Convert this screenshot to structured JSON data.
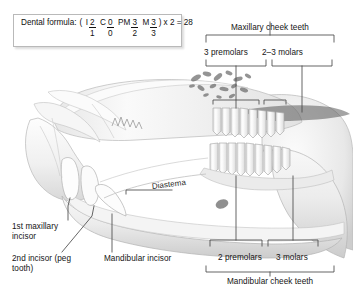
{
  "figure": {
    "background_color": "#ffffff",
    "line_color": "#3d3d3d",
    "bone_fill": "#f2f2f2",
    "bone_shadow": "#cfcfcf",
    "tooth_fill": "#fafafa"
  },
  "formula_box": {
    "label": "Dental formula:",
    "open_paren": "(",
    "close_paren": ")",
    "groups": [
      {
        "tag": "I",
        "numerator": "2",
        "denominator": "1"
      },
      {
        "tag": "C",
        "numerator": "0",
        "denominator": "0"
      },
      {
        "tag": "PM",
        "numerator": "3",
        "denominator": "2"
      },
      {
        "tag": "M",
        "numerator": "3",
        "denominator": "3"
      }
    ],
    "multiplier": "x 2 = 28"
  },
  "labels": {
    "maxillary_cheek_teeth": "Maxillary cheek teeth",
    "three_premolars": "3 premolars",
    "two_three_molars": "2–3 molars",
    "diastema": "Diastema",
    "first_maxillary_incisor": "1st maxillary incisor",
    "second_incisor_peg_tooth": "2nd incisor (peg tooth)",
    "mandibular_incisor": "Mandibular incisor",
    "two_premolars": "2 premolars",
    "three_molars": "3 molars",
    "mandibular_cheek_teeth": "Mandibular cheek teeth"
  }
}
